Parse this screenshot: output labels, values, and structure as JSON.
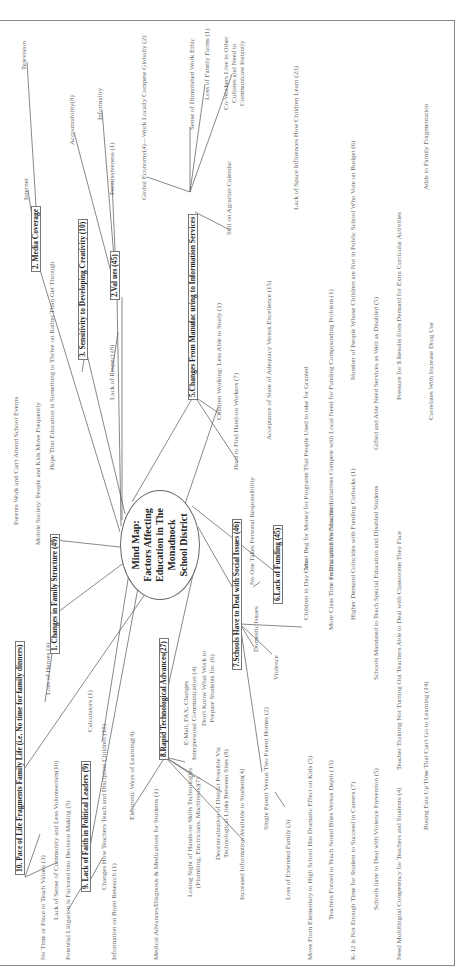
{
  "center": {
    "title": "Mind Map:\nFactors Affecting\nEducation in The\nMonadnock\nSchool District",
    "x": 372,
    "y": 120,
    "w": 108,
    "h": 78
  },
  "branches": [
    {
      "id": "b1",
      "label": "1. Changes in Family Structure (49)",
      "x": 318,
      "y": 50
    },
    {
      "id": "b2m",
      "label": "2. Media Coverage",
      "x": 700,
      "y": 31
    },
    {
      "id": "b2v",
      "label": "2.Val ues (45)",
      "x": 672,
      "y": 110
    },
    {
      "id": "b3",
      "label": "3. Sensitivity to Developing Creativity (10)",
      "x": 612,
      "y": 78
    },
    {
      "id": "b5",
      "label": "5.Changes From Manufac uring to Information Services",
      "x": 572,
      "y": 188
    },
    {
      "id": "b6",
      "label": "6.Lack of Funding (45)",
      "x": 368,
      "y": 273
    },
    {
      "id": "b7",
      "label": "7.Schools Have to Deal with Social Issues (46)",
      "x": 302,
      "y": 232
    },
    {
      "id": "b8",
      "label": "8.Rapid Technological Advances(27)",
      "x": 212,
      "y": 159
    },
    {
      "id": "b9",
      "label": "9. Lack of Faith in Political Leaders (9)",
      "x": 80,
      "y": 81
    },
    {
      "id": "b10",
      "label": "10. Pace of Life Fragments Family Life (i.e. No time for family dinners)",
      "x": 97,
      "y": 15
    }
  ],
  "nodes": [
    {
      "id": "television",
      "label": "Television",
      "x": 902,
      "y": 20
    },
    {
      "id": "internet",
      "label": "Internet",
      "x": 772,
      "y": 22
    },
    {
      "id": "hope",
      "label": "Hope That Education is Something to Thrive on Rather Than Get Through",
      "x": 502,
      "y": 48
    },
    {
      "id": "mobile",
      "label": "Mobile Society: People and Kids Move Frequently",
      "x": 427,
      "y": 34
    },
    {
      "id": "parents",
      "label": "Parents Work and Can't Attend School Events",
      "x": 447,
      "y": 12
    },
    {
      "id": "accountability",
      "label": "Accountability(8)",
      "x": 827,
      "y": 68
    },
    {
      "id": "informality",
      "label": "Informality",
      "x": 852,
      "y": 96
    },
    {
      "id": "permissiveness",
      "label": "Permissiveness (1)",
      "x": 777,
      "y": 108
    },
    {
      "id": "lack-respect",
      "label": "Lack of Respect (8)",
      "x": 572,
      "y": 108
    },
    {
      "id": "global",
      "label": "Global Economy(4)—Work Locally Compete Globally (2)",
      "x": 772,
      "y": 140
    },
    {
      "id": "work-ethic",
      "label": "Sense of Diminished Work Ethic",
      "x": 842,
      "y": 188
    },
    {
      "id": "family-farms",
      "label": "Loss of Family Farms (1)",
      "x": 872,
      "y": 203
    },
    {
      "id": "coworkers",
      "label": "Co-Workers Live in Other\nCultures and Need to\nCommunicate Instantly",
      "x": 862,
      "y": 222,
      "multi": true
    },
    {
      "id": "agrarian",
      "label": "Still on Agrarian Calendar",
      "x": 737,
      "y": 225
    },
    {
      "id": "children-working",
      "label": "Children Working: Less Able to Study (1)",
      "x": 552,
      "y": 215
    },
    {
      "id": "hands-on",
      "label": "Hard to Find Hand-on Workers (7)",
      "x": 502,
      "y": 232
    },
    {
      "id": "responsibility",
      "label": "No One Takes Personal Responsibility",
      "x": 387,
      "y": 248
    },
    {
      "id": "adequacy",
      "label": "Acceptance of State of Adequacy Versus Excellence (15)",
      "x": 532,
      "y": 265
    },
    {
      "id": "space",
      "label": "Lack of Space Influences How Children Learn (23)",
      "x": 762,
      "y": 292
    },
    {
      "id": "beg",
      "label": "Must Beg for Money for Programs That People Used to take for Granted",
      "x": 402,
      "y": 302
    },
    {
      "id": "voucher",
      "label": "Federal and State Voucher Initiatives Compete with Local Need for Funding Compounding Problem (1)",
      "x": 392,
      "y": 327
    },
    {
      "id": "voters",
      "label": "Number of People Whose Children are Not in Public School Who Vote on Budget (6)",
      "x": 592,
      "y": 349
    },
    {
      "id": "gifted",
      "label": "Gifted and Able Need Services as Well as Disabled (5)",
      "x": 522,
      "y": 372
    },
    {
      "id": "pressure",
      "label": "Pressure for $ Results from Demand for Extra Curricular Activities",
      "x": 572,
      "y": 395
    },
    {
      "id": "fragmentation",
      "label": "Adds to Family Fragmentation",
      "x": 782,
      "y": 422
    },
    {
      "id": "drug-use",
      "label": "Correlates With Increase Drug Use",
      "x": 552,
      "y": 427
    },
    {
      "id": "day-care",
      "label": "Children in Day Care",
      "x": 352,
      "y": 302
    },
    {
      "id": "discipline",
      "label": "More Class Time on Discipline Vs Education",
      "x": 342,
      "y": 327
    },
    {
      "id": "demand",
      "label": "Higher Demand Coincides with Funding Cutbacks (1)",
      "x": 352,
      "y": 349
    },
    {
      "id": "mandated",
      "label": "Schools Mandated to Teach Special Education and Disabled Students",
      "x": 292,
      "y": 372
    },
    {
      "id": "teacher-training",
      "label": "Teacher Training Not Turning Out Teachers Able to Deal with Classrooms They Face",
      "x": 202,
      "y": 395
    },
    {
      "id": "busing",
      "label": "Busing Eats Up Time That Can't Go to Learning (14)",
      "x": 142,
      "y": 422
    },
    {
      "id": "domestic",
      "label": "Domestic Issues",
      "x": 320,
      "y": 252
    },
    {
      "id": "violence",
      "label": "Violence",
      "x": 292,
      "y": 272
    },
    {
      "id": "dont-know",
      "label": "Don't Know What Work to\nPrepare Students for. (6)",
      "x": 246,
      "y": 200,
      "multi": true
    },
    {
      "id": "email",
      "label": "E-Mail, FAX, Changes\nInterpersonal Communication (4)",
      "x": 212,
      "y": 182,
      "multi": true
    },
    {
      "id": "decentralization",
      "label": "Decentralization of District Possible Via\nTechnological Links Between Sites (8)",
      "x": 112,
      "y": 214,
      "multi": true
    },
    {
      "id": "hands-on-skills",
      "label": "Losing Sight of Hands-on Skills Technologies\n(Plumbing, Electricians, Machinists)(7)",
      "x": 75,
      "y": 186,
      "multi": true
    },
    {
      "id": "increased-info",
      "label": "Increased Information Available to Students(4)",
      "x": 72,
      "y": 238
    },
    {
      "id": "single-parent",
      "label": "Single Parent Versus Two Parent Homes (2)",
      "x": 142,
      "y": 262
    },
    {
      "id": "extended-family",
      "label": "Loss of Extended Family (3)",
      "x": 72,
      "y": 284
    },
    {
      "id": "elementary",
      "label": "Move From Elementary to High School Has Dramatic Effect on Kids (5)",
      "x": 12,
      "y": 306
    },
    {
      "id": "sound-bites",
      "label": "Teachers Forced to Teach Sound Bites Versus Depth (15)",
      "x": 52,
      "y": 327
    },
    {
      "id": "k12",
      "label": "K-12 is Not Enough Time for Student to Succeed in Careers (7)",
      "x": 12,
      "y": 349
    },
    {
      "id": "violence-prevention",
      "label": "Schools have to Deal with Violence Prevention (5)",
      "x": 62,
      "y": 372
    },
    {
      "id": "multilingual",
      "label": "Need Multilingual Competency for Teachers and Students (4)",
      "x": 12,
      "y": 395
    },
    {
      "id": "medical",
      "label": "Medical Advances/Diagnosis & Medications for Students (1)",
      "x": 12,
      "y": 152
    },
    {
      "id": "brain-research",
      "label": "Information on Brain Research (1)",
      "x": 12,
      "y": 110
    },
    {
      "id": "teach-discipline",
      "label": "Changes How Teachers Teach and Discipline Children (18)",
      "x": 82,
      "y": 100
    },
    {
      "id": "electronic",
      "label": "Electronic Ways of Learning(4)",
      "x": 152,
      "y": 128
    },
    {
      "id": "calculators",
      "label": "Calculators (1)",
      "x": 240,
      "y": 86
    },
    {
      "id": "heroes",
      "label": "Loss of Heroes (4)",
      "x": 277,
      "y": 44
    },
    {
      "id": "no-time-values",
      "label": "No Time or Place to Teach Values (3)",
      "x": 12,
      "y": 39
    },
    {
      "id": "sense-community",
      "label": "Lack of Sense of Community and Less Volunteerism(10)",
      "x": 52,
      "y": 52
    },
    {
      "id": "litigation",
      "label": "Potential Litigation is Factored into Decision Making (5)",
      "x": 12,
      "y": 64
    }
  ],
  "connectors": [
    [
      425,
      120,
      432,
      55
    ],
    [
      410,
      125,
      360,
      58
    ],
    [
      405,
      130,
      230,
      102
    ],
    [
      395,
      140,
      125,
      90
    ],
    [
      385,
      150,
      200,
      22
    ],
    [
      440,
      120,
      702,
      40
    ],
    [
      446,
      121,
      677,
      117
    ],
    [
      452,
      122,
      675,
      122
    ],
    [
      458,
      125,
      622,
      86
    ],
    [
      470,
      132,
      575,
      193
    ],
    [
      468,
      185,
      565,
      218
    ],
    [
      466,
      192,
      398,
      278
    ],
    [
      445,
      198,
      375,
      238
    ],
    [
      420,
      198,
      285,
      168
    ],
    [
      702,
      40,
      782,
      28
    ],
    [
      702,
      40,
      910,
      27
    ],
    [
      625,
      86,
      600,
      82
    ],
    [
      677,
      117,
      840,
      74
    ],
    [
      677,
      117,
      790,
      112
    ],
    [
      677,
      117,
      862,
      102
    ],
    [
      640,
      118,
      600,
      112
    ],
    [
      780,
      190,
      795,
      147
    ],
    [
      780,
      190,
      845,
      190
    ],
    [
      780,
      190,
      888,
      205
    ],
    [
      780,
      190,
      898,
      232
    ],
    [
      760,
      195,
      742,
      230
    ],
    [
      575,
      195,
      558,
      220
    ],
    [
      575,
      195,
      510,
      238
    ],
    [
      390,
      260,
      385,
      253
    ],
    [
      348,
      240,
      325,
      254
    ],
    [
      348,
      240,
      318,
      272
    ],
    [
      348,
      240,
      345,
      302
    ],
    [
      348,
      240,
      200,
      262
    ],
    [
      215,
      165,
      210,
      185
    ],
    [
      215,
      165,
      160,
      130
    ],
    [
      215,
      165,
      195,
      195
    ],
    [
      215,
      165,
      180,
      222
    ],
    [
      215,
      165,
      130,
      245
    ],
    [
      165,
      285,
      180,
      275
    ],
    [
      95,
      25,
      138,
      40
    ],
    [
      95,
      25,
      110,
      58
    ],
    [
      88,
      88,
      115,
      103
    ],
    [
      92,
      86,
      62,
      68
    ],
    [
      270,
      45,
      318,
      52
    ]
  ],
  "colors": {
    "text": "#6a6a6a",
    "branch_text": "#222222",
    "line": "#555555"
  }
}
